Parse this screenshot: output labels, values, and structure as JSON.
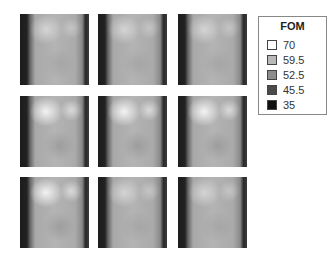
{
  "figure": {
    "panels": [
      {
        "row": 0,
        "col": 0,
        "x": 20,
        "y": 14,
        "dim": true
      },
      {
        "row": 0,
        "col": 1,
        "x": 98,
        "y": 14,
        "dim": true
      },
      {
        "row": 0,
        "col": 2,
        "x": 178,
        "y": 14,
        "dim": true
      },
      {
        "row": 1,
        "col": 0,
        "x": 20,
        "y": 96,
        "dim": false
      },
      {
        "row": 1,
        "col": 1,
        "x": 98,
        "y": 96,
        "dim": false
      },
      {
        "row": 1,
        "col": 2,
        "x": 178,
        "y": 96,
        "dim": false
      },
      {
        "row": 2,
        "col": 0,
        "x": 20,
        "y": 177,
        "dim": false
      },
      {
        "row": 2,
        "col": 1,
        "x": 98,
        "y": 177,
        "dim": true
      },
      {
        "row": 2,
        "col": 2,
        "x": 178,
        "y": 177,
        "dim": true
      }
    ]
  },
  "legend": {
    "title": "FOM",
    "items": [
      {
        "label": "70",
        "color": "#ffffff"
      },
      {
        "label": "59.5",
        "color": "#b8b8b8"
      },
      {
        "label": "52.5",
        "color": "#8c8c8c"
      },
      {
        "label": "45.5",
        "color": "#4a4a4a"
      },
      {
        "label": "35",
        "color": "#111111"
      }
    ]
  }
}
